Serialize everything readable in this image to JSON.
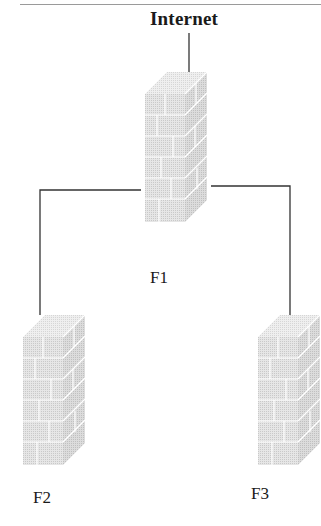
{
  "diagram": {
    "title": "Internet",
    "nodes": [
      {
        "id": "F1",
        "label": "F1",
        "type": "firewall"
      },
      {
        "id": "F2",
        "label": "F2",
        "type": "firewall"
      },
      {
        "id": "F3",
        "label": "F3",
        "type": "firewall"
      }
    ],
    "edges": [
      {
        "from": "Internet",
        "to": "F1"
      },
      {
        "from": "F1",
        "to": "F2"
      },
      {
        "from": "F1",
        "to": "F3"
      }
    ],
    "colors": {
      "line": "#333333",
      "wall_fill": "#e2e2e2",
      "wall_side": "#d4d4d4",
      "wall_top": "#ececec",
      "mortar": "#ffffff"
    }
  }
}
